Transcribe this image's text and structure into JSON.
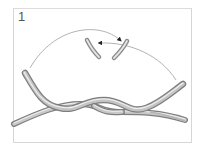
{
  "step": {
    "number": "1"
  },
  "illustration": {
    "subject": "two wires being twisted together",
    "elements": [
      "twisted-wire-pair",
      "wire-end-left",
      "wire-end-right",
      "rotation-arrow-clockwise",
      "rotation-arrow-counterclockwise"
    ],
    "colors": {
      "wire": "#a8a8a8",
      "wire_highlight": "#e6e6e6",
      "wire_shadow": "#7a7a7a",
      "arrow": "#9a9a9a",
      "arrowhead": "#222222",
      "frame": "#d6d6d6"
    }
  }
}
